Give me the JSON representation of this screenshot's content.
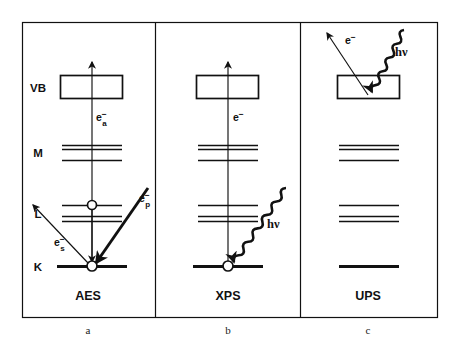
{
  "figure": {
    "background": "#ffffff",
    "ink": "#111111",
    "frame": {
      "x": 22,
      "y": 22,
      "width": 415,
      "height": 295
    },
    "dividers": [
      155,
      300
    ]
  },
  "panels": [
    {
      "id": "aes",
      "technique_label": "AES",
      "caption": "a",
      "caption_x": 88,
      "caption_y": 331,
      "label_x": 88,
      "label_y": 300,
      "center_x": 92,
      "level_labels": [
        {
          "text": "VB",
          "x": 38,
          "y": 87
        },
        {
          "text": "M",
          "x": 38,
          "y": 152
        },
        {
          "text": "L",
          "x": 38,
          "y": 213
        },
        {
          "text": "K",
          "x": 38,
          "y": 266
        }
      ],
      "vb_box": {
        "x": 60,
        "y": 75,
        "width": 62,
        "height": 23
      },
      "levels": [
        {
          "name": "M1",
          "x1": 62,
          "x2": 122,
          "y": 145,
          "thickness": 1.6
        },
        {
          "name": "M2",
          "x1": 62,
          "x2": 122,
          "y": 149,
          "thickness": 1.6
        },
        {
          "name": "M3",
          "x1": 62,
          "x2": 122,
          "y": 160,
          "thickness": 1.6
        },
        {
          "name": "L1",
          "x1": 62,
          "x2": 122,
          "y": 205,
          "thickness": 1.6
        },
        {
          "name": "L2",
          "x1": 62,
          "x2": 122,
          "y": 216,
          "thickness": 1.6
        },
        {
          "name": "L3",
          "x1": 62,
          "x2": 122,
          "y": 221,
          "thickness": 1.6
        },
        {
          "name": "K",
          "x1": 57,
          "x2": 127,
          "y": 266,
          "thickness": 3.0
        }
      ],
      "holes": [
        {
          "name": "l-shell-hole",
          "cx": 92,
          "cy": 205,
          "r": 4.5
        },
        {
          "name": "k-shell-hole",
          "cx": 92,
          "cy": 266,
          "r": 5.0
        }
      ],
      "arrows": [
        {
          "name": "auger-electron-up",
          "type": "straight-thin",
          "x1": 92,
          "y1": 266,
          "x2": 92,
          "y2": 62,
          "head": "end"
        },
        {
          "name": "auger-transition-down",
          "type": "straight-thin",
          "x1": 92,
          "y1": 205,
          "x2": 92,
          "y2": 262,
          "head": "end"
        },
        {
          "name": "primary-electron-in",
          "type": "straight-thick",
          "x1": 148,
          "y1": 188,
          "x2": 96,
          "y2": 263,
          "head": "end"
        },
        {
          "name": "secondary-electron-out",
          "type": "straight-thin",
          "x1": 88,
          "y1": 263,
          "x2": 33,
          "y2": 205,
          "head": "end"
        }
      ],
      "annotations": [
        {
          "name": "auger-electron-label",
          "base": "e",
          "sup": "−",
          "sub": "a",
          "x": 96,
          "y": 121
        },
        {
          "name": "primary-electron-label",
          "base": "e",
          "sup": "−",
          "sub": "p",
          "x": 139,
          "y": 202
        },
        {
          "name": "secondary-electron-label",
          "base": "e",
          "sup": "−",
          "sub": "s",
          "x": 54,
          "y": 246
        }
      ],
      "photons": []
    },
    {
      "id": "xps",
      "technique_label": "XPS",
      "caption": "b",
      "caption_x": 228,
      "caption_y": 331,
      "label_x": 228,
      "label_y": 300,
      "center_x": 228,
      "level_labels": [],
      "vb_box": {
        "x": 196,
        "y": 75,
        "width": 62,
        "height": 23
      },
      "levels": [
        {
          "name": "M1",
          "x1": 198,
          "x2": 258,
          "y": 145,
          "thickness": 1.6
        },
        {
          "name": "M2",
          "x1": 198,
          "x2": 258,
          "y": 149,
          "thickness": 1.6
        },
        {
          "name": "M3",
          "x1": 198,
          "x2": 258,
          "y": 160,
          "thickness": 1.6
        },
        {
          "name": "L1",
          "x1": 198,
          "x2": 258,
          "y": 205,
          "thickness": 1.6
        },
        {
          "name": "L2",
          "x1": 198,
          "x2": 258,
          "y": 216,
          "thickness": 1.6
        },
        {
          "name": "L3",
          "x1": 198,
          "x2": 258,
          "y": 221,
          "thickness": 1.6
        },
        {
          "name": "K",
          "x1": 193,
          "x2": 263,
          "y": 266,
          "thickness": 3.0
        }
      ],
      "holes": [
        {
          "name": "k-shell-hole",
          "cx": 228,
          "cy": 266,
          "r": 5.0
        }
      ],
      "arrows": [
        {
          "name": "photoelectron-up",
          "type": "straight-thin",
          "x1": 228,
          "y1": 266,
          "x2": 228,
          "y2": 62,
          "head": "end"
        }
      ],
      "annotations": [
        {
          "name": "photoelectron-label",
          "base": "e",
          "sup": "−",
          "sub": "",
          "x": 233,
          "y": 121
        }
      ],
      "photons": [
        {
          "name": "incident-photon",
          "x1": 286,
          "y1": 188,
          "x2": 234,
          "y2": 262,
          "label": "hν",
          "label_x": 267,
          "label_y": 228
        }
      ]
    },
    {
      "id": "ups",
      "technique_label": "UPS",
      "caption": "c",
      "caption_x": 368,
      "caption_y": 331,
      "label_x": 368,
      "label_y": 300,
      "center_x": 368,
      "level_labels": [],
      "vb_box": {
        "x": 337,
        "y": 75,
        "width": 62,
        "height": 23
      },
      "levels": [
        {
          "name": "M1",
          "x1": 339,
          "x2": 399,
          "y": 145,
          "thickness": 1.6
        },
        {
          "name": "M2",
          "x1": 339,
          "x2": 399,
          "y": 149,
          "thickness": 1.6
        },
        {
          "name": "M3",
          "x1": 339,
          "x2": 399,
          "y": 160,
          "thickness": 1.6
        },
        {
          "name": "L1",
          "x1": 339,
          "x2": 399,
          "y": 205,
          "thickness": 1.6
        },
        {
          "name": "L2",
          "x1": 339,
          "x2": 399,
          "y": 216,
          "thickness": 1.6
        },
        {
          "name": "L3",
          "x1": 339,
          "x2": 399,
          "y": 221,
          "thickness": 1.6
        },
        {
          "name": "K",
          "x1": 339,
          "x2": 399,
          "y": 266,
          "thickness": 3.0
        }
      ],
      "holes": [],
      "arrows": [
        {
          "name": "photoelectron-out",
          "type": "straight-thin",
          "x1": 368,
          "y1": 95,
          "x2": 327,
          "y2": 33,
          "head": "end"
        }
      ],
      "annotations": [
        {
          "name": "photoelectron-label",
          "base": "e",
          "sup": "−",
          "sub": "",
          "x": 345,
          "y": 44
        }
      ],
      "photons": [
        {
          "name": "incident-photon",
          "x1": 404,
          "y1": 30,
          "x2": 372,
          "y2": 92,
          "label": "hν",
          "label_x": 395,
          "label_y": 56
        }
      ]
    }
  ]
}
